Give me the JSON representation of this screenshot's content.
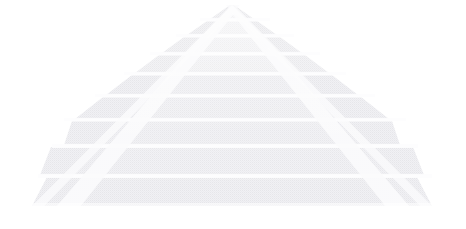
{
  "canvas": {
    "width": 466,
    "height": 229,
    "background_color": "#ffffff",
    "alt_text": "Faint light-grey step pyramid (ziggurat) on a white background"
  },
  "illustration": {
    "name": "step-pyramid",
    "title": "Step Pyramid",
    "subject": "ziggurat",
    "style": "flat silhouette, halftone dithered texture, very low contrast",
    "apex": {
      "x": 232,
      "y": 5
    },
    "base": {
      "left_x": 32,
      "right_x": 432,
      "y": 206
    },
    "tier_count": 9,
    "colors": {
      "background": "#ffffff",
      "tier_fill": "#f0f0f2",
      "tier_fill_light": "#f5f5f7",
      "tier_gap": "#fdfdfe",
      "stair_stripe": "#fbfbfc",
      "edge_shadow": "#ebebee",
      "texture_dot": "#e7e7ea"
    }
  },
  "chart_data": {
    "type": "area",
    "title": "Step Pyramid",
    "xlabel": "",
    "ylabel": "",
    "grid": false,
    "legend": "none",
    "xlim": [
      0,
      466
    ],
    "ylim": [
      0,
      229
    ],
    "tiers": [
      {
        "index": 1,
        "label": "Tier 1 (apex)",
        "top_y": 5,
        "bottom_y": 19,
        "half_width_top": 2,
        "half_width_bottom": 22,
        "height": 14,
        "width": 44,
        "fill": "#f2f2f4"
      },
      {
        "index": 2,
        "label": "Tier 2",
        "top_y": 21,
        "bottom_y": 35,
        "half_width_top": 25,
        "half_width_bottom": 45,
        "height": 14,
        "width": 90,
        "fill": "#f1f1f3"
      },
      {
        "index": 3,
        "label": "Tier 3",
        "top_y": 37,
        "bottom_y": 53,
        "half_width_top": 48,
        "half_width_bottom": 70,
        "height": 16,
        "width": 140,
        "fill": "#f0f0f2"
      },
      {
        "index": 4,
        "label": "Tier 4",
        "top_y": 55,
        "bottom_y": 73,
        "half_width_top": 73,
        "half_width_bottom": 97,
        "height": 18,
        "width": 194,
        "fill": "#f0f0f2"
      },
      {
        "index": 5,
        "label": "Tier 5",
        "top_y": 75,
        "bottom_y": 95,
        "half_width_top": 100,
        "half_width_bottom": 126,
        "height": 20,
        "width": 252,
        "fill": "#efeff1"
      },
      {
        "index": 6,
        "label": "Tier 6",
        "top_y": 97,
        "bottom_y": 119,
        "half_width_top": 129,
        "half_width_bottom": 157,
        "height": 22,
        "width": 314,
        "fill": "#efeff1"
      },
      {
        "index": 7,
        "label": "Tier 7",
        "top_y": 121,
        "bottom_y": 145,
        "half_width_top": 160,
        "half_width_bottom": 168,
        "height": 24,
        "width": 336,
        "fill": "#eeeef1"
      },
      {
        "index": 8,
        "label": "Tier 8",
        "top_y": 147,
        "bottom_y": 175,
        "half_width_top": 171,
        "half_width_bottom": 182,
        "height": 28,
        "width": 364,
        "fill": "#eeeef0"
      },
      {
        "index": 9,
        "label": "Tier 9 (base)",
        "top_y": 177,
        "bottom_y": 206,
        "half_width_top": 185,
        "half_width_bottom": 200,
        "height": 29,
        "width": 400,
        "fill": "#ededf0"
      }
    ],
    "stairways": [
      {
        "name": "left-stairway",
        "from": {
          "x": 232,
          "y": 8
        },
        "to": {
          "x": 60,
          "y": 206
        },
        "stripe_color": "#fbfbfc"
      },
      {
        "name": "right-stairway",
        "from": {
          "x": 232,
          "y": 8
        },
        "to": {
          "x": 404,
          "y": 206
        },
        "stripe_color": "#fbfbfc"
      }
    ]
  }
}
